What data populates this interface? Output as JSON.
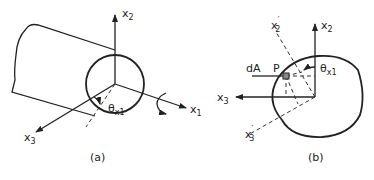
{
  "panels": [
    {
      "caption": "(a)",
      "labels": {
        "x2": "x",
        "x2_sub": "2",
        "x3": "x",
        "x3_sub": "3",
        "x1": "x",
        "x1_sub": "1",
        "theta": "θ",
        "theta_sub": "x1"
      },
      "elements": [
        "cylinder",
        "circular-end-section",
        "axis-x1",
        "axis-x2",
        "axis-x3",
        "rotation-arrow",
        "angle-theta-x1"
      ]
    },
    {
      "caption": "(b)",
      "labels": {
        "x2": "x",
        "x2_sub": "2",
        "x2p": "x",
        "x2p_sub": "2",
        "x2p_prime": "′",
        "x3": "x",
        "x3_sub": "3",
        "x3p": "x",
        "x3p_sub": "3",
        "x3p_prime": "′",
        "dA": "dA",
        "P": "P",
        "theta": "θ",
        "theta_sub": "x1"
      },
      "elements": [
        "cross-section-outline",
        "axis-x2",
        "axis-x3",
        "rotated-axis-x2-prime",
        "rotated-axis-x3-prime",
        "area-element-dA",
        "point-P",
        "angle-theta-x1"
      ]
    }
  ]
}
